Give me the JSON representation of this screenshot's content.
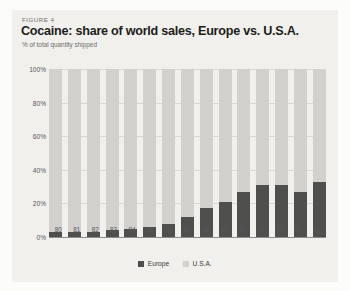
{
  "figure": {
    "kicker": "FIGURE 4",
    "title": "Cocaine: share of world sales, Europe vs. U.S.A.",
    "subtitle": "% of total quantity shipped"
  },
  "legend": {
    "position": "bottom-center",
    "entries": [
      {
        "label": "Europe",
        "color": "#4f4f4e",
        "swatch": "europe-swatch"
      },
      {
        "label": "U.S.A.",
        "color": "#d2d1cd",
        "swatch": "usa-swatch"
      }
    ]
  },
  "chart_data": {
    "type": "bar",
    "stacked": true,
    "title": "Cocaine: share of world sales, Europe vs. U.S.A.",
    "subtitle": "% of total quantity shipped",
    "xlabel": "",
    "ylabel": "% of total quantity shipped",
    "ylim": [
      0,
      100
    ],
    "yticks": [
      0,
      20,
      40,
      60,
      80,
      100
    ],
    "ytick_labels": [
      "0%",
      "20%",
      "40%",
      "60%",
      "80%",
      "100%"
    ],
    "grid": true,
    "categories": [
      "80",
      "81",
      "82",
      "83",
      "84",
      "85",
      "86",
      "87",
      "88",
      "89",
      "90",
      "91",
      "92",
      "93",
      "94"
    ],
    "series": [
      {
        "name": "Europe",
        "color": "#4f4f4e",
        "values": [
          3,
          3,
          3,
          4,
          5,
          6,
          8,
          12,
          17,
          21,
          27,
          31,
          31,
          27,
          33
        ]
      },
      {
        "name": "U.S.A.",
        "color": "#d2d1cd",
        "values": [
          97,
          97,
          97,
          96,
          95,
          94,
          92,
          88,
          83,
          79,
          73,
          69,
          69,
          73,
          67
        ]
      }
    ]
  }
}
